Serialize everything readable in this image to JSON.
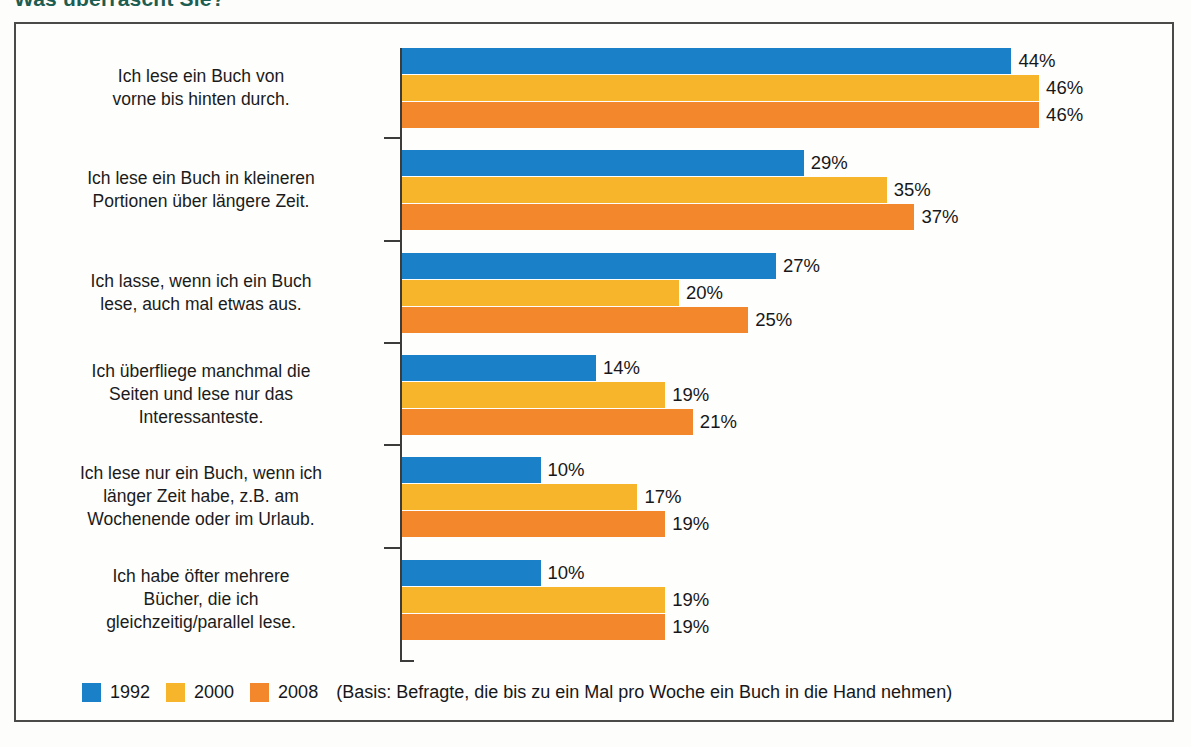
{
  "headline": "Was überrascht Sie?",
  "legend": {
    "series": [
      {
        "label": "1992",
        "color": "#1a81c8"
      },
      {
        "label": "2000",
        "color": "#f7b52b"
      },
      {
        "label": "2008",
        "color": "#f2872c"
      }
    ],
    "basis": "(Basis: Befragte, die bis zu ein Mal pro Woche ein Buch in die Hand nehmen)"
  },
  "chart_data": {
    "type": "bar",
    "orientation": "horizontal",
    "title": "Was überrascht Sie?",
    "xlabel": "",
    "ylabel": "",
    "xlim": [
      0,
      50
    ],
    "grid": false,
    "legend_position": "bottom-left",
    "value_suffix": "%",
    "note": "(Basis: Befragte, die bis zu ein Mal pro Woche ein Buch in die Hand nehmen)",
    "categories": [
      "Ich lese ein Buch von vorne bis hinten durch.",
      "Ich lese ein Buch in kleineren Portionen über längere Zeit.",
      "Ich lasse, wenn ich ein Buch lese, auch mal etwas aus.",
      "Ich überfliege manchmal die Seiten und lese nur das Interessanteste.",
      "Ich lese nur ein Buch, wenn ich länger Zeit habe, z.B. am Wochenende oder im Urlaub.",
      "Ich habe öfter mehrere Bücher, die ich gleichzeitig/parallel lese."
    ],
    "category_lines": [
      [
        "Ich lese ein Buch von",
        "vorne bis hinten durch."
      ],
      [
        "Ich lese ein Buch in kleineren",
        "Portionen über längere Zeit."
      ],
      [
        "Ich lasse, wenn ich ein Buch",
        "lese, auch mal etwas aus."
      ],
      [
        "Ich überfliege manchmal die",
        "Seiten und lese nur das",
        "Interessanteste."
      ],
      [
        "Ich lese nur ein Buch, wenn ich",
        "länger Zeit habe, z.B. am",
        "Wochenende oder im Urlaub."
      ],
      [
        "Ich habe öfter mehrere",
        "Bücher, die ich",
        "gleichzeitig/parallel lese."
      ]
    ],
    "series": [
      {
        "name": "1992",
        "color": "#1a81c8",
        "values": [
          44,
          29,
          27,
          14,
          10,
          10
        ]
      },
      {
        "name": "2000",
        "color": "#f7b52b",
        "values": [
          46,
          35,
          20,
          19,
          17,
          19
        ]
      },
      {
        "name": "2008",
        "color": "#f2872c",
        "values": [
          46,
          37,
          25,
          21,
          19,
          19
        ]
      }
    ],
    "value_labels": [
      [
        "44%",
        "46%",
        "46%"
      ],
      [
        "29%",
        "35%",
        "37%"
      ],
      [
        "27%",
        "20%",
        "25%"
      ],
      [
        "14%",
        "19%",
        "21%"
      ],
      [
        "10%",
        "17%",
        "19%"
      ],
      [
        "10%",
        "19%",
        "19%"
      ]
    ]
  }
}
